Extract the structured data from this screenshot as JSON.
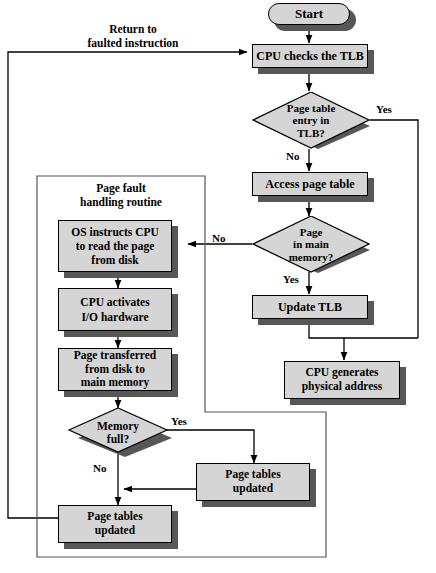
{
  "diagram": {
    "type": "flowchart",
    "colors": {
      "node_fill": "#d5d5d5",
      "node_border": "#000000",
      "shadow": "#575757",
      "line": "#000000",
      "background": "#ffffff"
    }
  },
  "nodes": {
    "start": "Start",
    "cpu_checks_tlb": "CPU checks the TLB",
    "page_table_entry_in_tlb": "Page table\nentry in\nTLB?",
    "page_table_entry_in_tlb_lines": [
      "Page table",
      "entry in",
      "TLB?"
    ],
    "access_page_table": "Access page table",
    "page_in_main_memory": "Page\nin main\nmemory?",
    "page_in_main_memory_lines": [
      "Page",
      "in main",
      "memory?"
    ],
    "update_tlb": "Update TLB",
    "cpu_generates_physical_address_lines": [
      "CPU generates",
      "physical address"
    ],
    "os_instructs_cpu_lines": [
      "OS instructs CPU",
      "to read the page",
      "from disk"
    ],
    "cpu_activates_io_lines": [
      "CPU activates",
      "I/O hardware"
    ],
    "page_transferred_lines": [
      "Page transferred",
      "from disk to",
      "main memory"
    ],
    "memory_full": "Memory\nfull?",
    "memory_full_lines": [
      "Memory",
      "full?"
    ],
    "page_tables_updated_right_lines": [
      "Page tables",
      "updated"
    ],
    "page_tables_updated_bottom_lines": [
      "Page tables",
      "updated"
    ]
  },
  "panel": {
    "title_lines": [
      "Page fault",
      "handling routine"
    ]
  },
  "labels": {
    "return_to_faulted_instruction_lines": [
      "Return to",
      "faulted instruction"
    ],
    "yes_tlb": "Yes",
    "no_tlb": "No",
    "no_main_memory": "No",
    "yes_main_memory": "Yes",
    "yes_memory_full": "Yes",
    "no_memory_full": "No"
  }
}
